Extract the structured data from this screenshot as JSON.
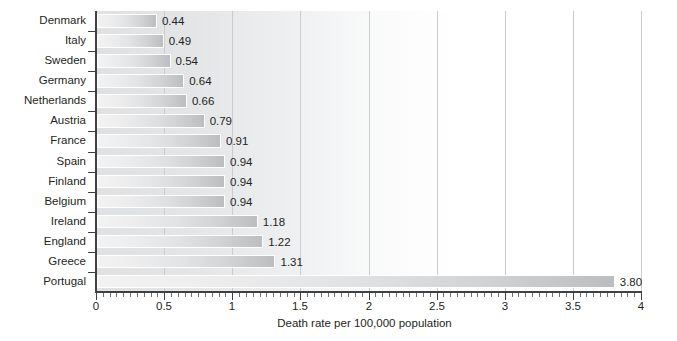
{
  "chart_data": {
    "type": "bar",
    "orientation": "horizontal",
    "title": "",
    "xlabel": "Death rate per 100,000 population",
    "ylabel": "",
    "xlim": [
      0,
      4
    ],
    "xticks": [
      0,
      0.5,
      1,
      1.5,
      2,
      2.5,
      3,
      3.5,
      4
    ],
    "xtick_labels": [
      "0",
      "0.5",
      "1",
      "1.5",
      "2",
      "2.5",
      "3",
      "3.5",
      "4"
    ],
    "minor_tick_step": 0.05,
    "grid": "vertical-major",
    "legend": "none",
    "categories": [
      "Denmark",
      "Italy",
      "Sweden",
      "Germany",
      "Netherlands",
      "Austria",
      "France",
      "Spain",
      "Finland",
      "Belgium",
      "Ireland",
      "England",
      "Greece",
      "Portugal"
    ],
    "values": [
      0.44,
      0.49,
      0.54,
      0.64,
      0.66,
      0.79,
      0.91,
      0.94,
      0.94,
      0.94,
      1.18,
      1.22,
      1.31,
      3.8
    ],
    "value_labels": [
      "0.44",
      "0.49",
      "0.54",
      "0.64",
      "0.66",
      "0.79",
      "0.91",
      "0.94",
      "0.94",
      "0.94",
      "1.18",
      "1.22",
      "1.31",
      "3.80"
    ],
    "colors": {
      "bar_light": "#f2f2f3",
      "bar_dark": "#bcbdbf",
      "bar_border": "#ffffff",
      "axis": "#3f4042",
      "gridline": "#c9cbcd",
      "text": "#231f20",
      "plot_background": "#dedfe1",
      "page_background": "#ffffff"
    }
  }
}
